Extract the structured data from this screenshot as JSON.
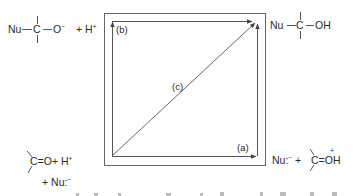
{
  "diagram": {
    "corners": {
      "top_left": {
        "nucleophile": "Nu",
        "carbon": "C",
        "group": "O",
        "group_charge": "−",
        "plus_term": "+ H",
        "plus_term_charge": "+"
      },
      "top_right": {
        "nucleophile": "Nu",
        "carbon": "C",
        "group": "OH"
      },
      "bottom_left": {
        "carbon": "C",
        "bond": "=",
        "group": "O",
        "plus_term": "+ H",
        "plus_term_charge": "+",
        "second_line": "+ Nu:",
        "second_line_charge": "−"
      },
      "bottom_right": {
        "nucleophile_term": "Nu:",
        "nucleophile_charge": "−",
        "plus": "+",
        "carbon": "C",
        "bond": "=",
        "group": "OH",
        "group_charge": "+"
      }
    },
    "paths": [
      {
        "id": "a",
        "label": "(a)",
        "route": "bottom-left → bottom-right → top-right"
      },
      {
        "id": "b",
        "label": "(b)",
        "route": "bottom-left → top-left → top-right"
      },
      {
        "id": "c",
        "label": "(c)",
        "route": "bottom-left → top-right (diagonal)"
      }
    ],
    "colors": {
      "line": "#555555",
      "text": "#2a2a2a",
      "background": "#ffffff"
    }
  }
}
